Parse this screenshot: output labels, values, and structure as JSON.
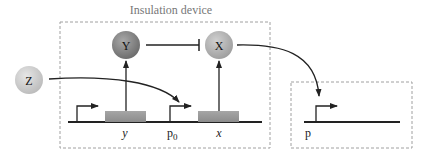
{
  "title": "Insulation device",
  "nodes": {
    "Y": {
      "label": "Y",
      "color": "#8a8a8a"
    },
    "X": {
      "label": "X",
      "color": "#b8b8b8"
    },
    "Z": {
      "label": "Z",
      "color": "#d4d4d4"
    }
  },
  "genes": {
    "y": {
      "label": "y"
    },
    "x": {
      "label": "x"
    }
  },
  "promoters": {
    "p0": {
      "label": "p",
      "subscript": "0"
    },
    "p": {
      "label": "p"
    }
  },
  "edges": [
    {
      "from": "Y",
      "to": "X",
      "type": "inhibition"
    },
    {
      "from": "Z",
      "to": "p0",
      "type": "activation"
    },
    {
      "from": "X",
      "to": "p",
      "type": "activation"
    },
    {
      "from": "gene-y",
      "to": "Y",
      "type": "expression"
    },
    {
      "from": "gene-x",
      "to": "X",
      "type": "expression"
    }
  ],
  "colors": {
    "gene_box": "#9a9a9a",
    "line": "#222222",
    "dashed_border": "#a0a0a0",
    "title": "#777777"
  }
}
